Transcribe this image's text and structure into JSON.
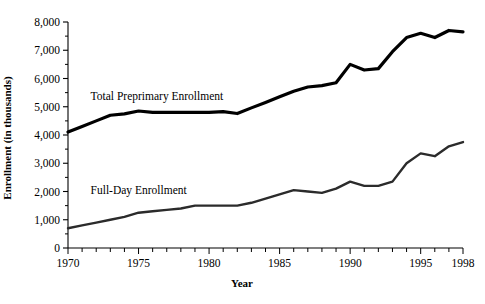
{
  "chart_data": {
    "type": "line",
    "title": "",
    "xlabel": "Year",
    "ylabel": "Enrollment (in thousands)",
    "xlim": [
      1970,
      1998
    ],
    "ylim": [
      0,
      8000
    ],
    "grid": false,
    "legend_position": "inline-annotation",
    "x": [
      1970,
      1971,
      1972,
      1973,
      1974,
      1975,
      1976,
      1977,
      1978,
      1979,
      1980,
      1981,
      1982,
      1983,
      1984,
      1985,
      1986,
      1987,
      1988,
      1989,
      1990,
      1991,
      1992,
      1993,
      1994,
      1995,
      1996,
      1997,
      1998
    ],
    "xticks": [
      1970,
      1975,
      1980,
      1985,
      1990,
      1995,
      1998
    ],
    "xticklabels": [
      "1970",
      "1975",
      "1980",
      "1985",
      "1990",
      "1995",
      "1998"
    ],
    "yticks": [
      0,
      1000,
      2000,
      3000,
      4000,
      5000,
      6000,
      7000,
      8000
    ],
    "yticklabels": [
      "0",
      "1,000",
      "2,000",
      "3,000",
      "4,000",
      "5,000",
      "6,000",
      "7,000",
      "8,000"
    ],
    "y_minor_step": 500,
    "series": [
      {
        "name": "Total Preprimary Enrollment",
        "color": "#000000",
        "linewidth": 3.2,
        "label_x": 1971.6,
        "label_y": 5250,
        "values": [
          4104,
          4300,
          4500,
          4700,
          4750,
          4850,
          4800,
          4800,
          4800,
          4800,
          4800,
          4830,
          4760,
          4960,
          5150,
          5350,
          5550,
          5700,
          5750,
          5850,
          6500,
          6300,
          6350,
          6950,
          7450,
          7600,
          7450,
          7700,
          7650
        ]
      },
      {
        "name": "Full-Day Enrollment",
        "color": "#2b2b2b",
        "linewidth": 2.4,
        "label_x": 1971.6,
        "label_y": 1900,
        "values": [
          698,
          800,
          900,
          1000,
          1100,
          1250,
          1300,
          1350,
          1400,
          1500,
          1500,
          1500,
          1500,
          1600,
          1750,
          1900,
          2050,
          2000,
          1950,
          2100,
          2350,
          2200,
          2200,
          2350,
          3000,
          3350,
          3250,
          3600,
          3750
        ]
      }
    ]
  },
  "annotations": {
    "series_1_label": "Total Preprimary Enrollment",
    "series_2_label": "Full-Day Enrollment"
  }
}
